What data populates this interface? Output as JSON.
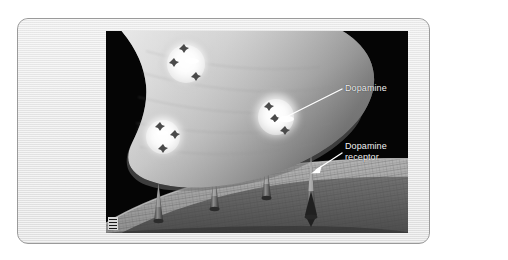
{
  "figure": {
    "frame_color": "#e9e9e9",
    "frame_border_color": "#9a9a9a",
    "image_background": "#050505"
  },
  "labels": {
    "dopamine": "Dopamine",
    "receptor_line1": "Dopamine",
    "receptor_line2": "receptor"
  },
  "illustration": {
    "presynaptic_terminal": "axon-terminal",
    "vesicle_count": 3,
    "receptor_count": 4,
    "postsynaptic_membrane": "dendrite-membrane",
    "leader_line_color": "#ffffff",
    "terminal_color": "#c9c9c9",
    "membrane_color": "#8a8a8a"
  },
  "caption": {
    "text": ""
  },
  "watermark": {
    "name": "corner-mark"
  }
}
